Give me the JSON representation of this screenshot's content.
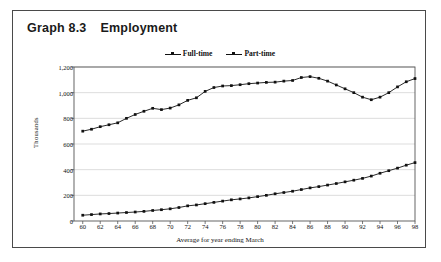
{
  "figure": {
    "label": "Graph 8.3",
    "title": "Employment"
  },
  "chart_data": {
    "type": "line",
    "title": "Employment",
    "xlabel": "Average for year ending March",
    "ylabel": "Thousands",
    "ylim": [
      0,
      1200
    ],
    "yticks": [
      "0",
      "200",
      "400",
      "600",
      "800",
      "1,000",
      "1,200"
    ],
    "ytick_values": [
      0,
      200,
      400,
      600,
      800,
      1000,
      1200
    ],
    "xlim": [
      59,
      98
    ],
    "xticks": [
      "60",
      "62",
      "64",
      "66",
      "68",
      "70",
      "72",
      "74",
      "76",
      "78",
      "80",
      "82",
      "84",
      "86",
      "88",
      "90",
      "92",
      "94",
      "96",
      "98"
    ],
    "xtick_values": [
      60,
      62,
      64,
      66,
      68,
      70,
      72,
      74,
      76,
      78,
      80,
      82,
      84,
      86,
      88,
      90,
      92,
      94,
      96,
      98
    ],
    "grid": "horizontal",
    "legend_position": "top-center",
    "x": [
      60,
      61,
      62,
      63,
      64,
      65,
      66,
      67,
      68,
      69,
      70,
      71,
      72,
      73,
      74,
      75,
      76,
      77,
      78,
      79,
      80,
      81,
      82,
      83,
      84,
      85,
      86,
      87,
      88,
      89,
      90,
      91,
      92,
      93,
      94,
      95,
      96,
      97,
      98
    ],
    "series": [
      {
        "name": "Full-time",
        "color": "#111111",
        "marker": "square",
        "values": [
          700,
          715,
          735,
          750,
          765,
          800,
          830,
          855,
          878,
          868,
          880,
          905,
          940,
          960,
          1010,
          1040,
          1052,
          1055,
          1062,
          1070,
          1075,
          1080,
          1082,
          1090,
          1095,
          1118,
          1125,
          1112,
          1090,
          1060,
          1030,
          1000,
          965,
          945,
          965,
          1000,
          1045,
          1085,
          1110
        ]
      },
      {
        "name": "Part-time",
        "color": "#111111",
        "marker": "triangle",
        "values": [
          45,
          50,
          55,
          58,
          62,
          66,
          70,
          75,
          82,
          88,
          95,
          105,
          118,
          125,
          135,
          145,
          155,
          165,
          172,
          180,
          190,
          200,
          212,
          222,
          232,
          245,
          258,
          268,
          280,
          292,
          305,
          318,
          332,
          350,
          372,
          392,
          412,
          435,
          455
        ]
      }
    ]
  }
}
